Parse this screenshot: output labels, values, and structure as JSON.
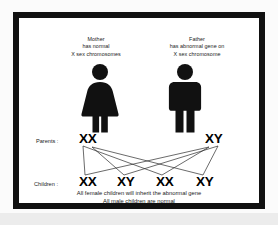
{
  "diagram": {
    "parents": [
      {
        "role_label": "Mother",
        "description_line_1": "has normal",
        "description_line_2": "X sex chromosomes",
        "figure_icon": "female-figure-icon",
        "genotype": "XX"
      },
      {
        "role_label": "Father",
        "description_line_1": "has abnormal gene on",
        "description_line_2": "X sex chromosome",
        "figure_icon": "male-figure-icon",
        "genotype": "XY"
      }
    ],
    "parents_row_label": "Parents :",
    "children_row_label": "Children :",
    "children_genotypes": [
      "XX",
      "XY",
      "XX",
      "XY"
    ],
    "conclusion_line_1": "All female children will inherit the abnormal gene",
    "conclusion_line_2": "All male children are normal",
    "colors": {
      "figure": "#111111",
      "frame": "#111111",
      "canvas": "#ffffff",
      "mat": "#fbfbfb",
      "page_background": "#ececec",
      "text": "#1a1a1a",
      "line": "#2b2b2b"
    }
  }
}
